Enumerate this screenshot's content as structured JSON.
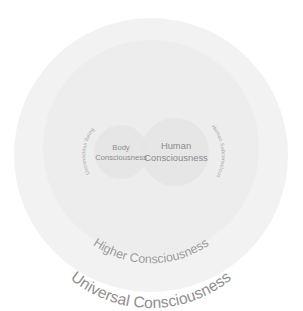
{
  "figure": {
    "name": "consciousness-nested-circles-diagram",
    "background_color": "#ffffff"
  },
  "circles": {
    "universal": {
      "label": "Universal Consciousness",
      "fill": "#f2f2f2",
      "cx": 151,
      "cy": 155,
      "r": 137
    },
    "higher": {
      "label": "Higher Consciousness",
      "fill": "#ededed",
      "cx": 151,
      "cy": 148,
      "r": 108
    },
    "body": {
      "label_line1": "Body",
      "label_line2": "Consciousness",
      "fill": "#e4e4e4",
      "cx": 121,
      "cy": 152,
      "r": 27
    },
    "human": {
      "label_line1": "Human",
      "label_line2": "Consciousness",
      "fill": "#e4e4e4",
      "cx": 175,
      "cy": 152,
      "r": 34
    }
  },
  "arc_labels": {
    "left": "Unconscious Being",
    "right": "Human Subconscious"
  },
  "colors": {
    "text_primary": "#8a8a8a",
    "text_secondary": "#9b9b9b",
    "text_faint": "#a6a6a6",
    "ring_outer": "#f2f2f2",
    "ring_middle": "#ededed",
    "circle_inner": "#e4e4e4"
  }
}
